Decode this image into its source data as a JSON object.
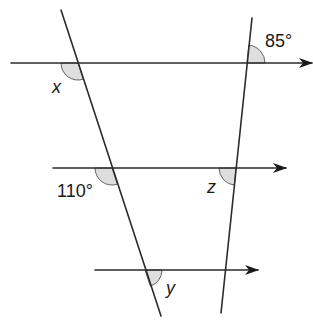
{
  "diagram": {
    "type": "parallel-lines-and-transversals",
    "colors": {
      "line": "#2b2b2b",
      "arc_fill": "#dedede",
      "text": "#1a1a1a",
      "background": "#ffffff"
    },
    "parallel_lines": [
      {
        "id": "top",
        "has_arrow": true
      },
      {
        "id": "middle",
        "has_arrow": true
      },
      {
        "id": "bottom",
        "has_arrow": true
      }
    ],
    "transversals": [
      {
        "id": "left"
      },
      {
        "id": "right"
      }
    ],
    "angles": {
      "x": {
        "label": "x",
        "kind": "unknown"
      },
      "angle85": {
        "label": "85°",
        "kind": "given",
        "value": 85
      },
      "angle110": {
        "label": "110°",
        "kind": "given",
        "value": 110
      },
      "z": {
        "label": "z",
        "kind": "unknown"
      },
      "y": {
        "label": "y",
        "kind": "unknown"
      }
    }
  }
}
